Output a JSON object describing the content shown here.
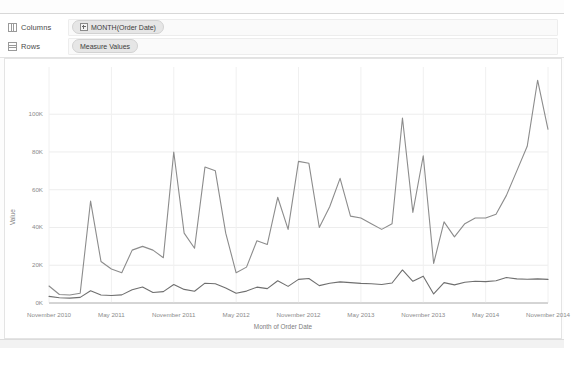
{
  "shelves": {
    "columns": {
      "label": "Columns",
      "icon": "columns-grid-icon",
      "pill": "MONTH(Order Date)",
      "pill_icon": "plus-expand-icon"
    },
    "rows": {
      "label": "Rows",
      "icon": "rows-grid-icon",
      "pill": "Measure Values"
    }
  },
  "chart_data": {
    "type": "line",
    "title": "",
    "xlabel": "Month of Order Date",
    "ylabel": "Value",
    "ylim": [
      0,
      125000
    ],
    "yticks": [
      0,
      20000,
      40000,
      60000,
      80000,
      100000
    ],
    "ytick_labels": [
      "0K",
      "20K",
      "40K",
      "60K",
      "80K",
      "100K"
    ],
    "grid": true,
    "legend": "none",
    "x_tick_labels": [
      "November 2010",
      "May 2011",
      "November 2011",
      "May 2012",
      "November 2012",
      "May 2013",
      "November 2013",
      "May 2014",
      "November 2014"
    ],
    "x_tick_indices": [
      0,
      6,
      12,
      18,
      24,
      30,
      36,
      42,
      48
    ],
    "x": [
      "November 2010",
      "December 2010",
      "January 2011",
      "February 2011",
      "March 2011",
      "April 2011",
      "May 2011",
      "June 2011",
      "July 2011",
      "August 2011",
      "September 2011",
      "October 2011",
      "November 2011",
      "December 2011",
      "January 2012",
      "February 2012",
      "March 2012",
      "April 2012",
      "May 2012",
      "June 2012",
      "July 2012",
      "August 2012",
      "September 2012",
      "October 2012",
      "November 2012",
      "December 2012",
      "January 2013",
      "February 2013",
      "March 2013",
      "April 2013",
      "May 2013",
      "June 2013",
      "July 2013",
      "August 2013",
      "September 2013",
      "October 2013",
      "November 2013",
      "December 2013",
      "January 2014",
      "February 2014",
      "March 2014",
      "April 2014",
      "May 2014",
      "June 2014",
      "July 2014",
      "August 2014",
      "September 2014",
      "October 2014",
      "November 2014"
    ],
    "series": [
      {
        "name": "Sales",
        "color": "#8c8c8c",
        "values": [
          9000,
          4500,
          4200,
          5200,
          54000,
          22000,
          18000,
          16000,
          28000,
          30000,
          28000,
          24000,
          80000,
          37000,
          29000,
          72000,
          70000,
          37000,
          16000,
          19000,
          33000,
          31000,
          56000,
          39000,
          75000,
          74000,
          40000,
          51000,
          66000,
          46000,
          45000,
          42000,
          39000,
          42000,
          98000,
          48000,
          78000,
          21000,
          43000,
          35000,
          42000,
          45000,
          45000,
          47000,
          57000,
          70000,
          83000,
          118000,
          92000
        ]
      },
      {
        "name": "Quantity",
        "color": "#6f6f6f",
        "values": [
          3500,
          2800,
          2600,
          3000,
          6500,
          4200,
          4000,
          4300,
          7000,
          8500,
          5600,
          6000,
          9800,
          7200,
          6200,
          10500,
          10200,
          8000,
          5200,
          6300,
          8400,
          7600,
          11800,
          8800,
          12500,
          13000,
          9200,
          10500,
          11200,
          10800,
          10400,
          10200,
          9800,
          10600,
          17500,
          11500,
          14200,
          4800,
          10800,
          9600,
          11000,
          11500,
          11300,
          11800,
          13500,
          12800,
          12600,
          12800,
          12500
        ]
      }
    ]
  }
}
